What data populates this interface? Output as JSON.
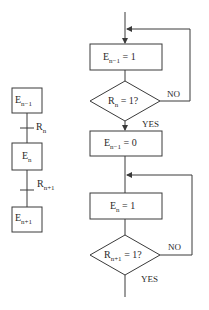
{
  "diagram": {
    "type": "flowchart",
    "left_chain": {
      "steps": [
        {
          "id": "step_n_minus_1",
          "base": "E",
          "sub": "n−1"
        },
        {
          "id": "step_n",
          "base": "E",
          "sub": "n"
        },
        {
          "id": "step_n_plus_1",
          "base": "E",
          "sub": "n+1"
        }
      ],
      "transitions": [
        {
          "id": "transition_n",
          "base": "R",
          "sub": "n"
        },
        {
          "id": "transition_n_plus_1",
          "base": "R",
          "sub": "n+1"
        }
      ]
    },
    "flowchart": {
      "nodes": [
        {
          "id": "set_prev",
          "kind": "process",
          "base": "E",
          "sub": "n−1",
          "rest": " = 1"
        },
        {
          "id": "test_rn",
          "kind": "decision",
          "base": "R",
          "sub": "n",
          "rest": " = 1?"
        },
        {
          "id": "reset_prev",
          "kind": "process",
          "base": "E",
          "sub": "n−1",
          "rest": " = 0"
        },
        {
          "id": "set_curr",
          "kind": "process",
          "base": "E",
          "sub": "n",
          "rest": " = 1"
        },
        {
          "id": "test_rn1",
          "kind": "decision",
          "base": "R",
          "sub": "n+1",
          "rest": " = 1?"
        }
      ],
      "labels": {
        "no1": "NO",
        "yes1": "YES",
        "no2": "NO",
        "yes2": "YES"
      }
    }
  }
}
